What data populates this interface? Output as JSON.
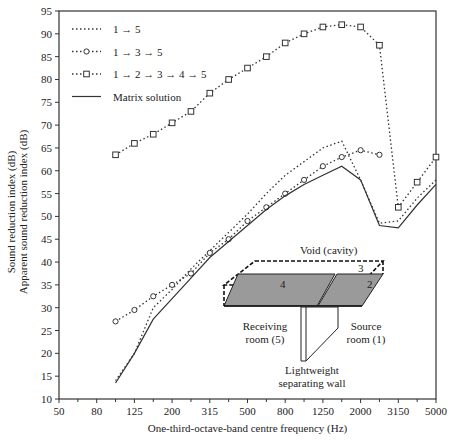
{
  "chart_data": {
    "type": "line",
    "title": "",
    "xlabel": "One-third-octave-band centre frequency (Hz)",
    "ylabel": [
      "Sound reduction index (dB)",
      "Apparent sound reduction index (dB)"
    ],
    "ylim": [
      10,
      95
    ],
    "yticks": [
      10,
      15,
      20,
      25,
      30,
      35,
      40,
      45,
      50,
      55,
      60,
      65,
      70,
      75,
      80,
      85,
      90,
      95
    ],
    "x_bands": [
      50,
      63,
      80,
      100,
      125,
      160,
      200,
      250,
      315,
      400,
      500,
      630,
      800,
      1000,
      1250,
      1600,
      2000,
      2500,
      3150,
      4000,
      5000
    ],
    "x_tick_labels": [
      "50",
      "80",
      "125",
      "200",
      "315",
      "500",
      "800",
      "1250",
      "2000",
      "3150",
      "5000"
    ],
    "x": [
      100,
      125,
      160,
      200,
      250,
      315,
      400,
      500,
      630,
      800,
      1000,
      1250,
      1600,
      2000,
      2500,
      3150,
      4000,
      5000
    ],
    "series": [
      {
        "name": "1 → 5",
        "style": "dotted",
        "marker": "none",
        "values": [
          14,
          20,
          30,
          34,
          38.5,
          42.5,
          46.5,
          50.5,
          55,
          59,
          62,
          65,
          66.5,
          58,
          48.5,
          49,
          54,
          58
        ]
      },
      {
        "name": "1 → 3 → 5",
        "style": "dash-dot",
        "marker": "circle",
        "values": [
          27,
          29.5,
          32.5,
          35,
          37.5,
          42,
          45,
          49,
          52,
          55,
          58,
          61,
          63,
          64.5,
          63.5,
          null,
          null,
          null
        ]
      },
      {
        "name": "1 → 2 → 3 → 4 → 5",
        "style": "dash-dot",
        "marker": "square",
        "values": [
          63.5,
          66,
          68,
          70.5,
          73,
          77,
          80,
          82.5,
          85,
          88,
          90,
          91.5,
          92,
          91.5,
          87.5,
          52,
          57.5,
          63
        ]
      },
      {
        "name": "Matrix solution",
        "style": "solid",
        "marker": "none",
        "values": [
          13.5,
          20,
          27.5,
          32,
          36.5,
          41,
          44.5,
          48,
          51.5,
          54.5,
          57,
          59,
          61,
          58,
          48,
          47.5,
          52.5,
          57
        ]
      }
    ],
    "legend_position": "upper-left",
    "grid": false,
    "annotations": {
      "void": "Void (cavity)",
      "subsystem_3": "3",
      "subsystem_4": "4",
      "subsystem_2": "2",
      "receiving": [
        "Receiving",
        "room (5)"
      ],
      "source": [
        "Source",
        "room (1)"
      ],
      "wall": [
        "Lightweight",
        "separating wall"
      ]
    }
  }
}
